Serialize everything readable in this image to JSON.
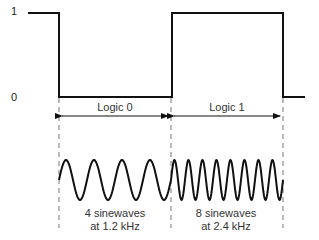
{
  "axis": {
    "high_label": "1",
    "low_label": "0"
  },
  "segments": [
    {
      "label": "Logic 0",
      "caption_line1": "4 sinewaves",
      "caption_line2": "at 1.2 kHz",
      "cycles": 4,
      "frequency": "1.2 kHz"
    },
    {
      "label": "Logic 1",
      "caption_line1": "8 sinewaves",
      "caption_line2": "at 2.4 kHz",
      "cycles": 8,
      "frequency": "2.4 kHz"
    }
  ],
  "colors": {
    "line": "#111111",
    "dash": "#777777",
    "text": "#333333"
  }
}
